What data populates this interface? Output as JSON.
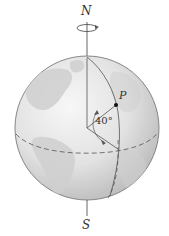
{
  "diagram": {
    "labels": {
      "north": "N",
      "south": "S",
      "point": "P",
      "latitude_angle": "40°"
    },
    "colors": {
      "globe_light": "#f2f2f2",
      "globe_mid": "#d4d4d4",
      "globe_dark": "#a8a8a8",
      "land": "#c6c6c6",
      "outline": "#7a7a7a",
      "lines": "#555555",
      "text": "#333333"
    },
    "elements": [
      "rotation-axis",
      "rotation-arrow-ellipse",
      "equator-dashed",
      "meridian-through-P",
      "radius-to-P",
      "latitude-angle-arc"
    ]
  }
}
